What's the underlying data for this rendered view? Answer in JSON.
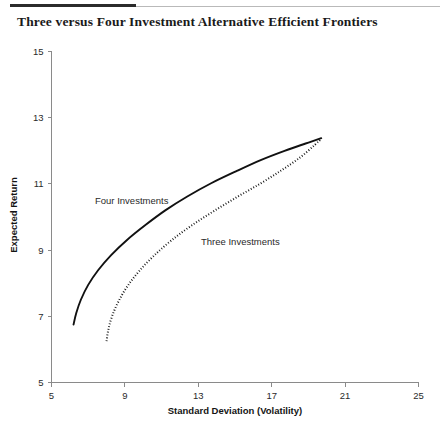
{
  "figure": {
    "title": "Three versus Four Investment Alternative Efficient Frontiers",
    "rule_color_thick": "#2b2b2b",
    "rule_color_thin": "#b9b9b9",
    "background": "#ffffff"
  },
  "chart_data": {
    "type": "line",
    "title": "Three versus Four Investment Alternative Efficient Frontiers",
    "xlabel": "Standard Deviation (Volatility)",
    "ylabel": "Expected Return",
    "xlim": [
      5,
      25
    ],
    "ylim": [
      5,
      15
    ],
    "xticks": [
      5,
      9,
      13,
      17,
      21,
      25
    ],
    "yticks": [
      5,
      7,
      9,
      11,
      13,
      15
    ],
    "xtick_labels": [
      "5",
      "9",
      "13",
      "17",
      "21",
      "25"
    ],
    "ytick_labels": [
      "5",
      "7",
      "9",
      "11",
      "13",
      "15"
    ],
    "grid": false,
    "legend": "inline-annotations",
    "series": [
      {
        "name": "Four Investments",
        "style": "solid",
        "color": "#111111",
        "annotation": "Four Investments",
        "x": [
          6.2,
          6.35,
          6.6,
          7.0,
          7.55,
          8.25,
          9.1,
          10.1,
          11.2,
          12.4,
          13.7,
          15.05,
          16.4,
          17.7,
          18.85,
          19.7
        ],
        "y": [
          6.75,
          7.1,
          7.5,
          7.95,
          8.4,
          8.85,
          9.3,
          9.75,
          10.2,
          10.62,
          11.02,
          11.38,
          11.72,
          12.0,
          12.22,
          12.38
        ]
      },
      {
        "name": "Three Investments",
        "style": "dotted",
        "color": "#111111",
        "annotation": "Three Investments",
        "x": [
          8.0,
          8.1,
          8.3,
          8.65,
          9.15,
          9.8,
          10.6,
          11.55,
          12.65,
          13.85,
          15.1,
          16.35,
          17.5,
          18.55,
          19.35,
          19.7
        ],
        "y": [
          6.25,
          6.6,
          7.0,
          7.45,
          7.92,
          8.38,
          8.84,
          9.3,
          9.75,
          10.18,
          10.6,
          11.0,
          11.4,
          11.8,
          12.18,
          12.36
        ]
      }
    ]
  },
  "annotations": {
    "four_investments": "Four Investments",
    "three_investments": "Three Investments"
  }
}
